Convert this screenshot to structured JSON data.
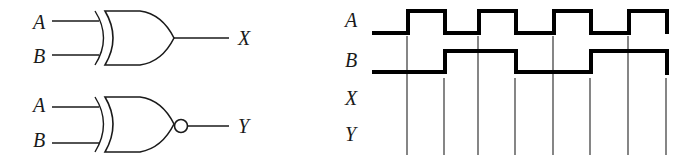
{
  "gates": {
    "xor": {
      "type": "XOR",
      "inputs": [
        "A",
        "B"
      ],
      "output": "X"
    },
    "xnor": {
      "type": "XNOR",
      "inputs": [
        "A",
        "B"
      ],
      "output": "Y"
    }
  },
  "timing": {
    "signals": [
      {
        "label": "A",
        "pattern": [
          0,
          1,
          0,
          1,
          0,
          1,
          0,
          1
        ]
      },
      {
        "label": "B",
        "pattern": [
          0,
          0,
          1,
          1,
          0,
          0,
          1,
          1
        ]
      },
      {
        "label": "X",
        "pattern": null
      },
      {
        "label": "Y",
        "pattern": null
      }
    ],
    "interval_count": 8
  },
  "colors": {
    "line": "#000000",
    "background": "#ffffff"
  }
}
